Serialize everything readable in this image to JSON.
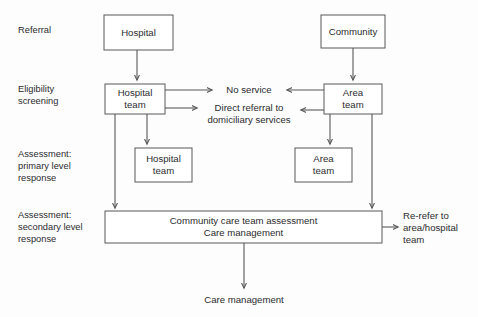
{
  "diagram": {
    "background_color": "#fdfdfd",
    "line_color": "#58585a",
    "text_color": "#2b2b2d",
    "stage_labels": [
      {
        "id": "referral",
        "lines": [
          "Referral"
        ]
      },
      {
        "id": "eligibility",
        "lines": [
          "Eligibility",
          "screening"
        ]
      },
      {
        "id": "assessment_primary",
        "lines": [
          "Assessment:",
          "primary level",
          "response"
        ]
      },
      {
        "id": "assessment_secondary",
        "lines": [
          "Assessment:",
          "secondary level",
          "response"
        ]
      }
    ],
    "nodes": [
      {
        "id": "hospital",
        "lines": [
          "Hospital"
        ]
      },
      {
        "id": "community",
        "lines": [
          "Community"
        ]
      },
      {
        "id": "hospital_team_screening",
        "lines": [
          "Hospital",
          "team"
        ]
      },
      {
        "id": "area_team_screening",
        "lines": [
          "Area",
          "team"
        ]
      },
      {
        "id": "hospital_team_primary",
        "lines": [
          "Hospital",
          "team"
        ]
      },
      {
        "id": "area_team_primary",
        "lines": [
          "Area",
          "team"
        ]
      },
      {
        "id": "community_care",
        "lines": [
          "Community care team assessment",
          "Care management"
        ]
      }
    ],
    "free_labels": [
      {
        "id": "no_service",
        "lines": [
          "No service"
        ]
      },
      {
        "id": "direct_referral",
        "lines": [
          "Direct referral to",
          "domiciliary services"
        ]
      },
      {
        "id": "re_refer",
        "lines": [
          "Re-refer to",
          "area/hospital",
          "team"
        ]
      },
      {
        "id": "care_management_outcome",
        "lines": [
          "Care management"
        ]
      }
    ]
  }
}
